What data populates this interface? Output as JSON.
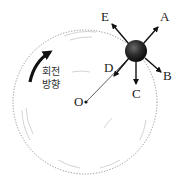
{
  "diagram": {
    "type": "circular-motion-force-directions",
    "center_label": "O",
    "rotation_label_line1": "회전",
    "rotation_label_line2": "방향",
    "arrow_labels": {
      "A": "A",
      "B": "B",
      "C": "C",
      "D": "D",
      "E": "E"
    },
    "colors": {
      "ball": "#2a2a2a",
      "arrows": "#111111",
      "circle": "#777777",
      "rotation_arrow": "#111111"
    }
  }
}
